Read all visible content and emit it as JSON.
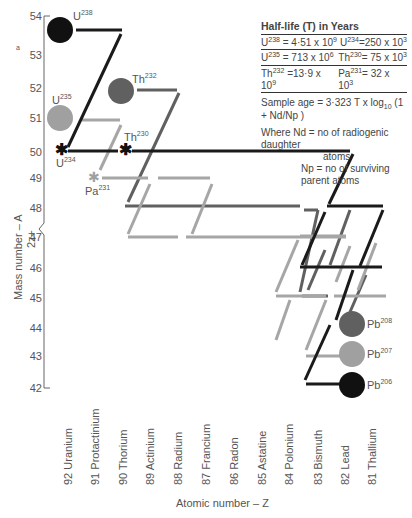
{
  "legend": {
    "title": "Half-life (T) in Years",
    "rows": [
      {
        "left_iso": "U",
        "left_mass": "238",
        "left_val": "= 4·51 x 10",
        "left_exp": "9",
        "right_iso": "U",
        "right_mass": "234",
        "right_val": "=250 x 10",
        "right_exp": "3"
      },
      {
        "left_iso": "U",
        "left_mass": "235",
        "left_val": "= 713 x 10",
        "left_exp": "6",
        "right_iso": "Th",
        "right_mass": "230",
        "right_val": "= 75 x 10",
        "right_exp": "3"
      },
      {
        "left_iso": "Th",
        "left_mass": "232",
        "left_val": "=13·9 x 10",
        "left_exp": "9",
        "right_iso": "Pa",
        "right_mass": "231",
        "right_val": "= 32 x 10",
        "right_exp": "3"
      }
    ],
    "formula": "Sample age = 3·323 T x log",
    "formula_sub": "10",
    "formula_tail": "(1 + Nd/Np )",
    "where_nd": "Where Nd = no of radiogenic daughter",
    "where_nd2": "atoms",
    "where_np": "Np = no of surviving parent atoms"
  },
  "y_axis": {
    "title": "Mass number – A",
    "subtitle": "2z+",
    "ticks": [
      "54",
      "53",
      "52",
      "51",
      "50",
      "49",
      "48",
      "47",
      "46",
      "45",
      "44",
      "43",
      "42"
    ],
    "top_mark": "a"
  },
  "x_axis": {
    "title": "Atomic number – Z",
    "elements": [
      "92 Uranium",
      "91 Protactinium",
      "90 Thorium",
      "89 Actinium",
      "88 Radium",
      "87 Francium",
      "86 Radon",
      "85 Astatine",
      "84 Polonium",
      "83 Bismuth",
      "82 Lead",
      "81 Thallium"
    ]
  },
  "isotopes": [
    {
      "label": "U",
      "mass": "238",
      "kind": "parent",
      "color": "#111111"
    },
    {
      "label": "U",
      "mass": "235",
      "kind": "parent",
      "color": "#9a9a9a"
    },
    {
      "label": "Th",
      "mass": "232",
      "kind": "parent",
      "color": "#5e5e5e"
    },
    {
      "label": "Th",
      "mass": "230",
      "kind": "intermediate",
      "color": "#111111"
    },
    {
      "label": "U",
      "mass": "234",
      "kind": "intermediate",
      "color": "#111111"
    },
    {
      "label": "Pa",
      "mass": "231",
      "kind": "intermediate",
      "color": "#9a9a9a"
    },
    {
      "label": "Pb",
      "mass": "208",
      "kind": "daughter",
      "color": "#5e5e5e"
    },
    {
      "label": "Pb",
      "mass": "207",
      "kind": "daughter",
      "color": "#9a9a9a"
    },
    {
      "label": "Pb",
      "mass": "206",
      "kind": "daughter",
      "color": "#111111"
    }
  ],
  "colors": {
    "u238_series": "#1a1a1a",
    "u235_series": "#a0a0a0",
    "th232_series": "#606060"
  }
}
